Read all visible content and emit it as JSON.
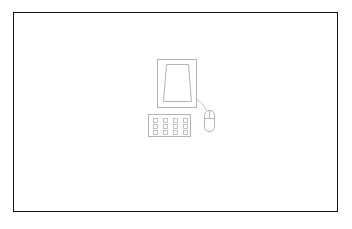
{
  "scene": {
    "title": "Desktop computer line drawing",
    "background_color": "#ffffff",
    "stroke_color": "#b3b3b3",
    "frame_color": "#111111"
  },
  "frame": {
    "label": "Image border",
    "x": 13,
    "y": 12,
    "width": 325,
    "height": 200,
    "stroke_width": 1.6
  },
  "objects": {
    "monitor": {
      "label": "Monitor",
      "icon": "monitor-icon",
      "x": 157,
      "y": 59,
      "width": 40,
      "height": 49
    },
    "screen": {
      "label": "Screen",
      "icon": "screen-icon",
      "shape": "trapezoid",
      "top_width": 22,
      "bottom_width": 28,
      "x": 163,
      "y": 64,
      "height": 38
    },
    "keyboard": {
      "label": "Keyboard",
      "icon": "keyboard-icon",
      "x": 148,
      "y": 114,
      "width": 43,
      "height": 23,
      "key_rows": 3,
      "key_columns": 4,
      "key_size": 4
    },
    "mouse": {
      "label": "Mouse",
      "icon": "mouse-icon",
      "x": 204,
      "y": 110,
      "width": 11,
      "height": 22,
      "buttons": 2
    },
    "cable": {
      "label": "Mouse cable",
      "icon": "cable-icon",
      "from_x": 196,
      "from_y": 99,
      "to_x": 207,
      "to_y": 110
    }
  }
}
